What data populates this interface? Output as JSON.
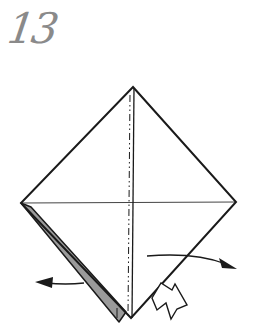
{
  "step": {
    "number": "13"
  },
  "diagram": {
    "colors": {
      "line": "#1a1a1a",
      "flap": "#9a9a9a",
      "number": "#8a8a8a",
      "background": "#ffffff"
    },
    "vertices": {
      "top": [
        133,
        87
      ],
      "left": [
        21,
        203
      ],
      "right": [
        236,
        202
      ],
      "bottom": [
        131,
        318
      ]
    },
    "folds": [
      {
        "type": "mountain-fold",
        "orientation": "vertical",
        "from": [
          133,
          87
        ],
        "to": [
          131,
          318
        ]
      },
      {
        "type": "crease",
        "orientation": "horizontal",
        "from": [
          21,
          203
        ],
        "to": [
          236,
          202
        ]
      }
    ],
    "flap": {
      "shape": "thin-strip",
      "edge": "lower-left",
      "color": "gray"
    },
    "arrows": [
      {
        "name": "arrow-left",
        "direction": "left",
        "kind": "move"
      },
      {
        "name": "arrow-right",
        "direction": "right",
        "kind": "move"
      },
      {
        "name": "push-arrow",
        "direction": "up-left",
        "kind": "push-hollow"
      }
    ]
  }
}
